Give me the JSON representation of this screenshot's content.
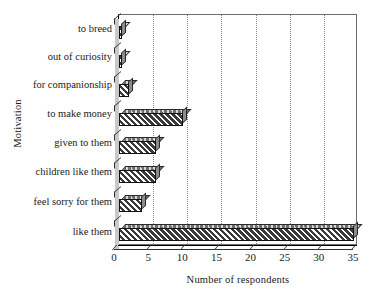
{
  "chart_data": {
    "type": "bar",
    "orientation": "horizontal",
    "title": "",
    "xlabel": "Number of respondents",
    "ylabel": "Motivation",
    "categories": [
      "to breed",
      "out of curiosity",
      "for companionship",
      "to make money",
      "given to them",
      "children like them",
      "feel sorry for them",
      "like them"
    ],
    "values": [
      1,
      1,
      2,
      10,
      6,
      6,
      4,
      35
    ],
    "xlim": [
      0,
      35
    ],
    "ylim": null,
    "xticks": [
      0,
      5,
      10,
      15,
      20,
      25,
      30,
      35
    ],
    "xtick_labels": [
      "0",
      "5",
      "10",
      "15",
      "20",
      "25",
      "30",
      "35"
    ],
    "grid": "vertical-dotted",
    "legend": null,
    "style": {
      "bar_fill": "#4a4a4a",
      "bar_hatch": "diagonal",
      "bar_edge": "#111111",
      "three_d": true,
      "gridline_color": "#8a8a8a",
      "axis_color": "#000000",
      "background": "#ffffff"
    }
  }
}
